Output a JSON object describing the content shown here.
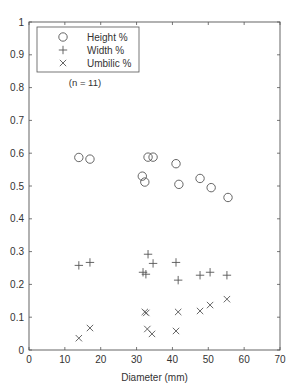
{
  "chart_data": {
    "type": "scatter",
    "title": "",
    "xlabel": "Diameter (mm)",
    "ylabel": "",
    "xlim": [
      0,
      70
    ],
    "ylim": [
      0,
      1
    ],
    "xticks": [
      0,
      10,
      20,
      30,
      40,
      50,
      60,
      70
    ],
    "yticks": [
      0,
      0.1,
      0.2,
      0.3,
      0.4,
      0.5,
      0.6,
      0.7,
      0.8,
      0.9,
      1
    ],
    "xtick_labels": [
      "0",
      "10",
      "20",
      "30",
      "40",
      "50",
      "60",
      "70"
    ],
    "ytick_labels": [
      "0",
      "0.1",
      "0.2",
      "0.3",
      "0.4",
      "0.5",
      "0.6",
      "0.7",
      "0.8",
      "0.9",
      "1"
    ],
    "grid": false,
    "legend_position": "top-left",
    "annotation": "(n = 11)",
    "series": [
      {
        "name": "Height %",
        "marker": "circle",
        "x": [
          13.9,
          17.0,
          33.2,
          34.6,
          31.6,
          32.3,
          41.0,
          41.8,
          47.7,
          50.8,
          55.5
        ],
        "y": [
          0.587,
          0.582,
          0.588,
          0.588,
          0.53,
          0.512,
          0.568,
          0.505,
          0.523,
          0.495,
          0.465
        ]
      },
      {
        "name": "Width %",
        "marker": "plus",
        "x": [
          13.9,
          17.0,
          33.2,
          34.6,
          31.8,
          32.6,
          41.0,
          41.6,
          47.7,
          50.5,
          55.2
        ],
        "y": [
          0.258,
          0.267,
          0.292,
          0.264,
          0.237,
          0.231,
          0.267,
          0.213,
          0.228,
          0.237,
          0.228
        ]
      },
      {
        "name": "Umbilic %",
        "marker": "x",
        "x": [
          13.9,
          17.0,
          32.3,
          32.7,
          33.0,
          34.3,
          41.0,
          41.6,
          47.7,
          50.5,
          55.2
        ],
        "y": [
          0.036,
          0.067,
          0.116,
          0.113,
          0.064,
          0.049,
          0.058,
          0.116,
          0.119,
          0.137,
          0.155
        ]
      }
    ]
  }
}
